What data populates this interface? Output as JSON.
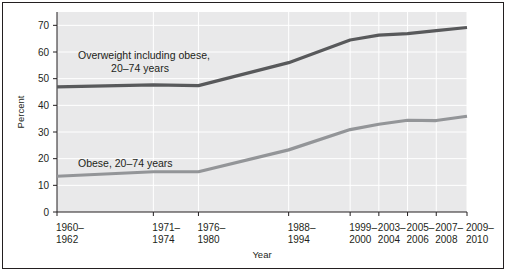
{
  "chart_data": {
    "type": "line",
    "title": "",
    "xlabel": "Year",
    "ylabel": "Percent",
    "ylim": [
      0,
      75
    ],
    "yticks": [
      0,
      10,
      20,
      30,
      40,
      50,
      60,
      70
    ],
    "ytick_labels": [
      "0",
      "10",
      "20",
      "30",
      "40",
      "50",
      "60",
      "70"
    ],
    "grid": true,
    "legend_position": "inline-annotations",
    "categories": [
      "1960–1962",
      "1971–1974",
      "1976–1980",
      "1988–1994",
      "1999–2000",
      "2003–2004",
      "2005–2006",
      "2007–2008",
      "2009–2010"
    ],
    "xtick_labels_line1": [
      "1960–",
      "1971–",
      "1976–",
      "1988–",
      "1999–",
      "2003–",
      "2005–",
      "2007–",
      "2009–"
    ],
    "xtick_labels_line2": [
      "1962",
      "1974",
      "1980",
      "1994",
      "2000",
      "2004",
      "2006",
      "2008",
      "2010"
    ],
    "series": [
      {
        "name": "Overweight including obese, 20–74 years",
        "color": "#58595b",
        "values": [
          46.9,
          47.7,
          47.4,
          56.0,
          64.5,
          66.3,
          66.9,
          68.0,
          69.2
        ]
      },
      {
        "name": "Obese, 20–74 years",
        "color": "#939598",
        "values": [
          13.4,
          15.1,
          15.1,
          23.3,
          30.9,
          32.9,
          34.4,
          34.3,
          35.9
        ]
      }
    ],
    "annotations": [
      {
        "name": "overweight-annotation",
        "line1": "Overweight including obese,",
        "line2": "20–74 years"
      },
      {
        "name": "obese-annotation",
        "text": "Obese, 20–74 years"
      }
    ],
    "colors": {
      "plot_background": "#e9e9ea",
      "grid": "#ffffff",
      "frame": "#231f20",
      "series_dark": "#58595b",
      "series_light": "#939598"
    }
  }
}
